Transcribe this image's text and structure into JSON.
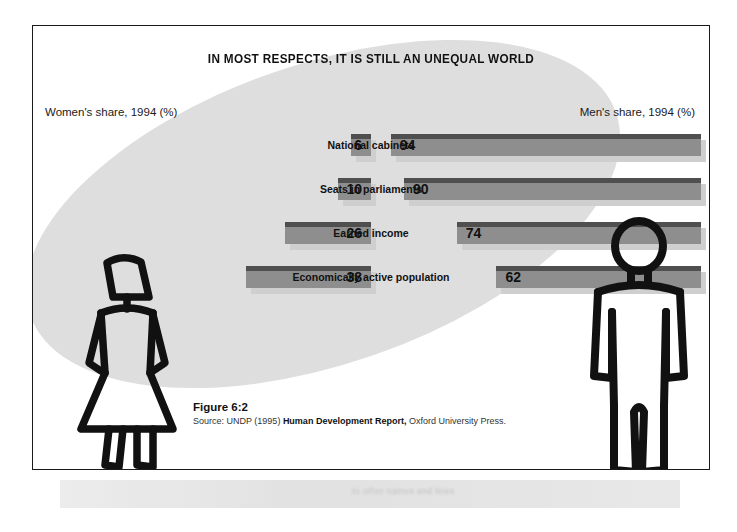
{
  "chart_data": {
    "type": "bar",
    "title": "IN MOST RESPECTS, IT IS STILL AN UNEQUAL WORLD",
    "subtitle": "",
    "xlabel": "",
    "ylabel": "",
    "xlim": [
      0,
      100
    ],
    "grid": false,
    "legend_position": "top",
    "orientation": "horizontal-diverging",
    "units": "%",
    "categories": [
      "National cabinets",
      "Seats in parliaments",
      "Earned income",
      "Economically active population"
    ],
    "series": [
      {
        "name": "Women's share, 1994 (%)",
        "side": "left",
        "values": [
          6,
          10,
          26,
          38
        ]
      },
      {
        "name": "Men's share, 1994 (%)",
        "side": "right",
        "values": [
          94,
          90,
          74,
          62
        ]
      }
    ],
    "annotations": [
      "Figure 6:2",
      "Source: UNDP (1995) Human Development Report, Oxford University Press."
    ]
  },
  "header": {
    "title": "IN MOST RESPECTS, IT IS STILL AN UNEQUAL WORLD"
  },
  "axes": {
    "left_label": "Women's share, 1994 (%)",
    "right_label": "Men's share, 1994 (%)"
  },
  "rows": [
    {
      "category": "National cabinets",
      "left_value": "6",
      "right_value": "94"
    },
    {
      "category": "Seats in parliaments",
      "left_value": "10",
      "right_value": "90"
    },
    {
      "category": "Earned income",
      "left_value": "26",
      "right_value": "74"
    },
    {
      "category": "Economically active population",
      "left_value": "38",
      "right_value": "62"
    }
  ],
  "caption": {
    "figure": "Figure 6:2",
    "source_prefix": "Source: UNDP (1995) ",
    "source_title": "Human Development Report,",
    "source_suffix": " Oxford University Press."
  },
  "figures": {
    "female": "female-stick-figure",
    "male": "male-stick-figure"
  },
  "artifacts": {
    "bleed_text": "to other names and lines"
  },
  "colors": {
    "bar_body": "#8e8e8e",
    "bar_top": "#4f4f4f",
    "bar_shadow": "#cfcfcf",
    "background_ellipse": "#dedede",
    "frame_border": "#1a1a1a",
    "text": "#111111",
    "page": "#ffffff"
  }
}
